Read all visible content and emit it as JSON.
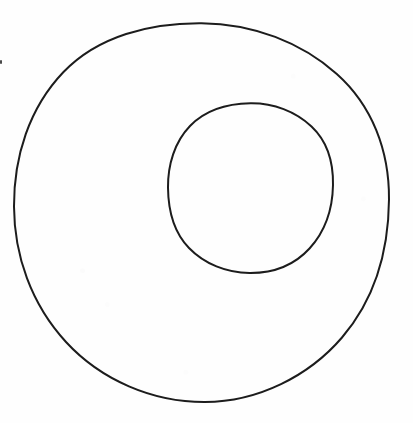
{
  "figure": {
    "title": "Two circles: a large outer circle and a smaller circle inside it, offset up and to the right",
    "background_color": "#fefefe",
    "stroke_color": "#1c1c1c",
    "canvas": {
      "width": 413,
      "height": 423
    },
    "shapes": [
      {
        "name": "outer-circle",
        "kind": "ellipse",
        "label": "Outer circle",
        "center_x": 201.5,
        "center_y": 212.5,
        "radius_x": 187.5,
        "radius_y": 189.5,
        "stroke_width": 2,
        "fill": "none",
        "bounds": {
          "left": 14,
          "right": 389,
          "top": 23,
          "bottom": 402
        }
      },
      {
        "name": "inner-circle",
        "kind": "ellipse",
        "label": "Inner circle",
        "center_x": 250.5,
        "center_y": 188.0,
        "radius_x": 82.5,
        "radius_y": 85.0,
        "stroke_width": 2,
        "fill": "none",
        "bounds": {
          "left": 168,
          "right": 333,
          "top": 103,
          "bottom": 273
        }
      }
    ],
    "artifacts": [
      {
        "name": "scan-speck",
        "label": "Small dark scan speck near left edge",
        "x": 0,
        "y": 60,
        "width": 2,
        "height": 4,
        "color": "#2a2a2a"
      }
    ]
  },
  "chart_data": {
    "type": "diagram",
    "title": "",
    "subtitle": "",
    "xlabel": "",
    "ylabel": "",
    "legend": [],
    "annotations": [],
    "grid": false,
    "elements": [
      {
        "id": "outer-circle",
        "shape": "circle",
        "cx": 201.5,
        "cy": 212.5,
        "r": 188.5,
        "stroke": "#1c1c1c",
        "fill": "none"
      },
      {
        "id": "inner-circle",
        "shape": "circle",
        "cx": 250.5,
        "cy": 188.0,
        "r": 83.8,
        "stroke": "#1c1c1c",
        "fill": "none"
      }
    ]
  }
}
